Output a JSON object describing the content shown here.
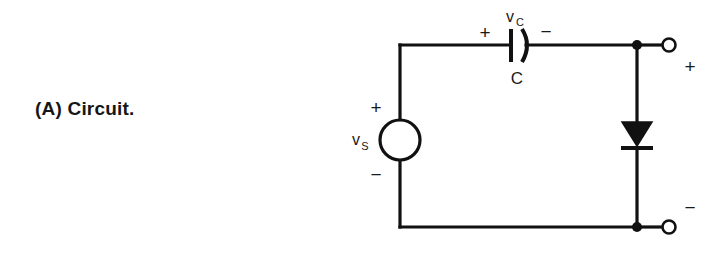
{
  "figure": {
    "caption": "(A) Circuit.",
    "kind": "circuit-diagram",
    "background_color": "#ffffff",
    "line_color": "#111111"
  },
  "circuit": {
    "source": {
      "name": "voltage-source",
      "symbol": "circle",
      "label": "v",
      "label_subscript": "S",
      "plus_sign": "+",
      "minus_sign": "−"
    },
    "capacitor": {
      "name": "capacitor",
      "symbol": "curved-plate-capacitor",
      "voltage_label": "v",
      "voltage_label_subscript": "C",
      "component_label": "C",
      "plus_sign": "+",
      "minus_sign": "−"
    },
    "diode": {
      "name": "diode",
      "symbol": "diode-triangle-bar",
      "orientation": "cathode-down"
    },
    "output_terminals": {
      "top": {
        "name": "output-terminal-positive",
        "sign": "+",
        "marker": "open-circle"
      },
      "bottom": {
        "name": "output-terminal-negative",
        "sign": "−",
        "marker": "open-circle"
      }
    },
    "junction_nodes": [
      "top-right-node",
      "bottom-right-node"
    ]
  }
}
